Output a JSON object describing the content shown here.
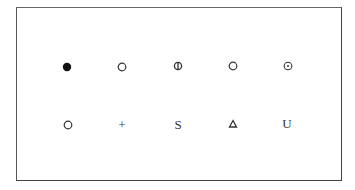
{
  "diagram": {
    "rows": [
      {
        "symbols": [
          {
            "icon": "filled-circle-icon",
            "label": ""
          },
          {
            "icon": "open-circle-icon",
            "label": ""
          },
          {
            "icon": "circle-vertical-bar-icon",
            "label": ""
          },
          {
            "icon": "open-circle-icon",
            "label": ""
          },
          {
            "icon": "circle-dot-icon",
            "label": ""
          }
        ]
      },
      {
        "symbols": [
          {
            "icon": "open-circle-icon",
            "label": ""
          },
          {
            "icon": "plus-text",
            "label": "+"
          },
          {
            "icon": "letter-s-text",
            "label": "S"
          },
          {
            "icon": "triangle-icon",
            "label": ""
          },
          {
            "icon": "letter-u-text",
            "label": "U"
          }
        ]
      }
    ],
    "colors": {
      "stroke": "#333333",
      "frame": "#444444",
      "background": "#ffffff"
    }
  }
}
